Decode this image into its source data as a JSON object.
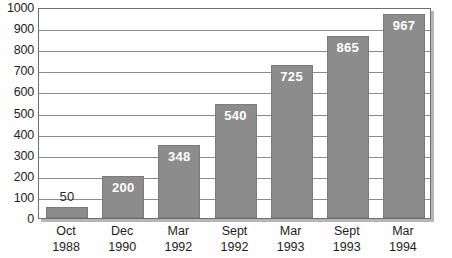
{
  "chart_data": {
    "type": "bar",
    "title": "",
    "subtitle": "",
    "xlabel": "",
    "ylabel": "",
    "categories": [
      "Oct 1988",
      "Dec 1990",
      "Mar 1992",
      "Sept 1992",
      "Mar 1993",
      "Sept 1993",
      "Mar 1994"
    ],
    "category_lines": [
      [
        "Oct",
        "1988"
      ],
      [
        "Dec",
        "1990"
      ],
      [
        "Mar",
        "1992"
      ],
      [
        "Sept",
        "1992"
      ],
      [
        "Mar",
        "1993"
      ],
      [
        "Sept",
        "1993"
      ],
      [
        "Mar",
        "1994"
      ]
    ],
    "values": [
      50,
      200,
      348,
      540,
      725,
      865,
      967
    ],
    "value_labels": [
      "50",
      "200",
      "348",
      "540",
      "725",
      "865",
      "967"
    ],
    "label_placement": [
      "outside",
      "inside",
      "inside",
      "inside",
      "inside",
      "inside",
      "inside"
    ],
    "ylim": [
      0,
      1000
    ],
    "ytick_step": 100,
    "yticks": [
      0,
      100,
      200,
      300,
      400,
      500,
      600,
      700,
      800,
      900,
      1000
    ],
    "ytick_labels": [
      "0",
      "100",
      "200",
      "300",
      "400",
      "500",
      "600",
      "700",
      "800",
      "900",
      "1000"
    ],
    "grid": true,
    "grid_axis": "y",
    "legend": null,
    "legend_position": "none",
    "colors": {
      "bar_fill": "#8c8c8c",
      "bar_border": "#7b7b7b",
      "gridline": "#8d8d8d",
      "frame": "#6e6e6e",
      "plot_background": "#ffffff",
      "page_background": "#fefefe",
      "tick_label": "#1d1d1d",
      "value_label_inside": "#ffffff",
      "value_label_outside": "#2a2a2a"
    }
  }
}
